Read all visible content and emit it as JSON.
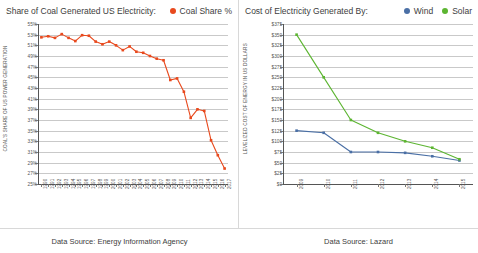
{
  "left_panel": {
    "header_title": "Share of Coal Generated US Electricity:",
    "legend": [
      {
        "label": "Coal Share %",
        "color": "#e8491d",
        "icon": "legend-dot-icon"
      }
    ],
    "footer": "Data Source: Energy Information Agency"
  },
  "right_panel": {
    "header_title": "Cost of Electricity Generated By:",
    "legend": [
      {
        "label": "Wind",
        "color": "#4a6fa5",
        "icon": "legend-dot-icon"
      },
      {
        "label": "Solar",
        "color": "#5cb531",
        "icon": "legend-dot-icon"
      }
    ],
    "footer": "Data Source: Lazard"
  },
  "chart_data": [
    {
      "type": "line",
      "title": "Share of Coal Generated US Electricity",
      "xlabel": "",
      "ylabel": "COAL'S SHARE OF US POWER GENERATION",
      "ylim": [
        25,
        55
      ],
      "ytick_step": 2,
      "ytick_labels": [
        "55%",
        "53%",
        "51%",
        "49%",
        "47%",
        "45%",
        "43%",
        "41%",
        "39%",
        "37%",
        "35%",
        "33%",
        "31%",
        "29%",
        "27%",
        "25%"
      ],
      "grid": true,
      "legend_position": "top-right",
      "categories": [
        "1990",
        "1991",
        "1992",
        "1993",
        "1994",
        "1995",
        "1996",
        "1997",
        "1998",
        "1999",
        "2000",
        "2001",
        "2002",
        "2003",
        "2004",
        "2005",
        "2006",
        "2007",
        "2008",
        "2009",
        "2010",
        "2011",
        "2012",
        "2013",
        "2014",
        "2015",
        "2016",
        "2017"
      ],
      "series": [
        {
          "name": "Coal Share %",
          "color": "#e8491d",
          "values": [
            52.5,
            52.7,
            52.4,
            53.1,
            52.4,
            51.8,
            52.9,
            52.8,
            51.7,
            51.2,
            51.7,
            51.0,
            50.1,
            50.8,
            49.8,
            49.6,
            49.0,
            48.5,
            48.2,
            44.5,
            44.8,
            42.3,
            37.4,
            39.0,
            38.7,
            33.2,
            30.4,
            27.9
          ]
        }
      ]
    },
    {
      "type": "line",
      "title": "Cost of Electricity Generated By",
      "xlabel": "",
      "ylabel": "LEVELIZED COST OF ENERGY IN US DOLLARS",
      "ylim": [
        0,
        375
      ],
      "ytick_step": 25,
      "ytick_labels": [
        "$375",
        "$350",
        "$325",
        "$300",
        "$275",
        "$250",
        "$225",
        "$200",
        "$175",
        "$150",
        "$125",
        "$100",
        "$75",
        "$50",
        "$25",
        "$0"
      ],
      "grid": true,
      "legend_position": "top-right",
      "categories": [
        "2009",
        "2010",
        "2011",
        "2012",
        "2013",
        "2014",
        "2015"
      ],
      "series": [
        {
          "name": "Wind",
          "color": "#4a6fa5",
          "values": [
            125,
            120,
            75,
            75,
            73,
            65,
            55
          ]
        },
        {
          "name": "Solar",
          "color": "#5cb531",
          "values": [
            350,
            250,
            150,
            120,
            100,
            85,
            58
          ]
        }
      ]
    }
  ]
}
